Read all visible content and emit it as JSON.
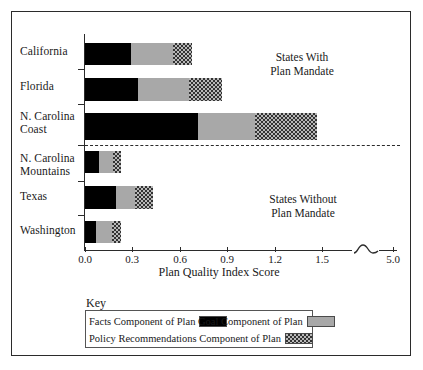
{
  "chart_data": {
    "type": "bar",
    "orientation": "horizontal",
    "stacked": true,
    "title": "",
    "xlabel": "Plan Quality Index Score",
    "ylabel": "",
    "xlim": [
      0.0,
      1.6
    ],
    "xticks": [
      "0.0",
      "0.3",
      "0.6",
      "0.9",
      "1.2",
      "1.5",
      "5.0"
    ],
    "xtick_values": [
      0.0,
      0.3,
      0.6,
      0.9,
      1.2,
      1.5,
      5.0
    ],
    "axis_break": true,
    "grid": false,
    "legend_position": "bottom-left",
    "categories": [
      "California",
      "Florida",
      "N. Carolina\nCoast",
      "N. Carolina\nMountains",
      "Texas",
      "Washington"
    ],
    "series": [
      {
        "name": "Facts Component of Plan",
        "color": "#000000",
        "pattern": "solid-black",
        "values": [
          0.29,
          0.34,
          0.72,
          0.09,
          0.2,
          0.07
        ]
      },
      {
        "name": "Goal Component of Plan",
        "color": "#a8a8a8",
        "pattern": "solid-gray",
        "values": [
          0.27,
          0.32,
          0.36,
          0.09,
          0.12,
          0.1
        ]
      },
      {
        "name": "Policy Recommendations Component of Plan",
        "color": "#b9b9b9",
        "pattern": "checkered",
        "values": [
          0.12,
          0.21,
          0.4,
          0.05,
          0.11,
          0.06
        ]
      }
    ],
    "totals": [
      0.68,
      0.87,
      1.48,
      0.23,
      0.43,
      0.23
    ],
    "annotations": [
      {
        "text": "States With\nPlan Mandate",
        "group": "mandate"
      },
      {
        "text": "States Without\nPlan Mandate",
        "group": "no-mandate"
      }
    ],
    "divider": {
      "style": "dashed",
      "between": [
        "N. Carolina Coast",
        "N. Carolina Mountains"
      ]
    }
  },
  "key": {
    "title": "Key",
    "entries": [
      {
        "label": "Facts Component of Plan",
        "swatch": "solid-black"
      },
      {
        "label": "Goal Component of Plan",
        "swatch": "solid-gray"
      },
      {
        "label": "Policy Recommendations Component of Plan",
        "swatch": "checkered"
      }
    ]
  },
  "axis": {
    "title": "Plan Quality Index Score",
    "tick_0": "0.0",
    "tick_1": "0.3",
    "tick_2": "0.6",
    "tick_3": "0.9",
    "tick_4": "1.2",
    "tick_5": "1.5",
    "tick_6": "5.0"
  },
  "categories": {
    "c0": "California",
    "c1": "Florida",
    "c2": "N. Carolina\nCoast",
    "c3": "N. Carolina\nMountains",
    "c4": "Texas",
    "c5": "Washington"
  },
  "notes": {
    "with_mandate": "States With\nPlan Mandate",
    "without_mandate": "States Without\nPlan Mandate"
  }
}
